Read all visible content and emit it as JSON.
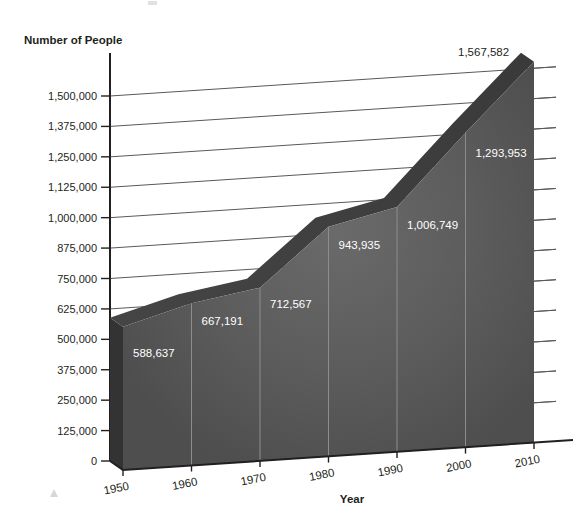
{
  "chart_data": {
    "type": "area",
    "title": "",
    "xlabel": "Year",
    "ylabel": "Number of People",
    "categories": [
      "1950",
      "1960",
      "1970",
      "1980",
      "1990",
      "2000",
      "2010"
    ],
    "values": [
      588637,
      667191,
      712567,
      943935,
      1006749,
      1293953,
      1567582
    ],
    "value_labels": [
      "588,637",
      "667,191",
      "712,567",
      "943,935",
      "1,006,749",
      "1,293,953",
      "1,567,582"
    ],
    "y_ticks": [
      0,
      125000,
      250000,
      375000,
      500000,
      625000,
      750000,
      875000,
      1000000,
      1125000,
      1250000,
      1375000,
      1500000
    ],
    "y_tick_labels": [
      "0",
      "125,000",
      "250,000",
      "375,000",
      "500,000",
      "625,000",
      "750,000",
      "875,000",
      "1,000,000",
      "1,125,000",
      "1,250,000",
      "1,375,000",
      "1,500,000"
    ],
    "ylim": [
      0,
      1500000
    ],
    "grid": true,
    "legend": "none",
    "style": "3d-area",
    "colors": {
      "area_front": "#575757",
      "area_top": "#3c3c3c",
      "area_side": "#333333",
      "gridline": "#58595b",
      "axis": "#231f20",
      "label_text": "#ffffff",
      "background": "#ffffff"
    }
  },
  "axes": {
    "y_axis_title": "Number of People",
    "x_axis_title": "Year"
  }
}
